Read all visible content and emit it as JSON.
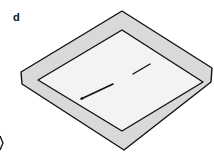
{
  "panel": {
    "label": "d"
  },
  "diagram": {
    "outer_fill": "#d9d9d9",
    "inner_fill": "#f2f2f2",
    "stroke": "#111111",
    "segments": 2
  }
}
